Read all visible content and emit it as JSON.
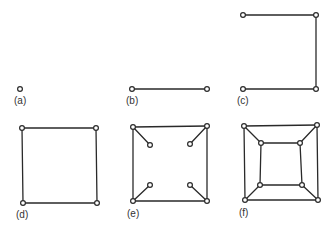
{
  "figure": {
    "background": "#ffffff",
    "line_color": "#2a2a2a",
    "panels": [
      {
        "id": "a",
        "label": "(a)",
        "label_pos": [
          14,
          104
        ],
        "nodes": [
          [
            20,
            89
          ]
        ],
        "edges": []
      },
      {
        "id": "b",
        "label": "(b)",
        "label_pos": [
          126,
          104
        ],
        "nodes": [
          [
            132,
            89
          ],
          [
            207,
            89
          ]
        ],
        "edges": [
          [
            0,
            1
          ]
        ]
      },
      {
        "id": "c",
        "label": "(c)",
        "label_pos": [
          237,
          104
        ],
        "nodes": [
          [
            243,
            15
          ],
          [
            316,
            15
          ],
          [
            316,
            89
          ],
          [
            243,
            89
          ]
        ],
        "edges": [
          [
            0,
            1
          ],
          [
            1,
            2
          ],
          [
            2,
            3
          ]
        ]
      },
      {
        "id": "d",
        "label": "(d)",
        "label_pos": [
          16,
          218
        ],
        "nodes": [
          [
            22,
            128
          ],
          [
            96,
            128
          ],
          [
            97,
            203
          ],
          [
            23,
            203
          ]
        ],
        "edges": [
          [
            0,
            1
          ],
          [
            1,
            2
          ],
          [
            2,
            3
          ],
          [
            3,
            0
          ]
        ]
      },
      {
        "id": "e",
        "label": "(e)",
        "label_pos": [
          127,
          217
        ],
        "nodes": [
          [
            133,
            127
          ],
          [
            207,
            126
          ],
          [
            207,
            201
          ],
          [
            133,
            201
          ],
          [
            150,
            145
          ],
          [
            190,
            144
          ],
          [
            190,
            185
          ],
          [
            150,
            185
          ]
        ],
        "edges": [
          [
            0,
            1
          ],
          [
            1,
            2
          ],
          [
            2,
            3
          ],
          [
            3,
            0
          ],
          [
            0,
            4
          ],
          [
            1,
            5
          ],
          [
            2,
            6
          ],
          [
            3,
            7
          ]
        ]
      },
      {
        "id": "f",
        "label": "(f)",
        "label_pos": [
          239,
          216
        ],
        "nodes": [
          [
            244,
            126
          ],
          [
            317,
            125
          ],
          [
            318,
            200
          ],
          [
            245,
            200
          ],
          [
            261,
            143
          ],
          [
            300,
            143
          ],
          [
            302,
            185
          ],
          [
            260,
            185
          ]
        ],
        "edges": [
          [
            0,
            1
          ],
          [
            1,
            2
          ],
          [
            2,
            3
          ],
          [
            3,
            0
          ],
          [
            0,
            4
          ],
          [
            1,
            5
          ],
          [
            2,
            6
          ],
          [
            3,
            7
          ],
          [
            4,
            5
          ],
          [
            5,
            6
          ],
          [
            6,
            7
          ],
          [
            7,
            4
          ]
        ]
      }
    ]
  },
  "labels": {
    "a": "(a)",
    "b": "(b)",
    "c": "(c)",
    "d": "(d)",
    "e": "(e)",
    "f": "(f)"
  }
}
